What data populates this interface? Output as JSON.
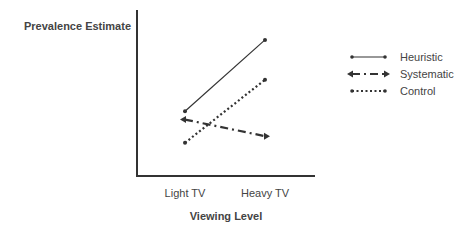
{
  "chart_data": {
    "type": "line",
    "title": "",
    "xlabel": "Viewing Level",
    "ylabel": "Prevalence Estimate",
    "categories": [
      "Light TV",
      "Heavy TV"
    ],
    "ylim": [
      0,
      10
    ],
    "y_ticks_shown": false,
    "grid": false,
    "legend_position": "right",
    "series": [
      {
        "name": "Heuristic",
        "values": [
          3.9,
          8.2
        ],
        "style": "solid",
        "marker": "dot",
        "color": "#333333"
      },
      {
        "name": "Systematic",
        "values": [
          3.4,
          2.4
        ],
        "style": "dash-dot",
        "marker": "arrow",
        "color": "#333333"
      },
      {
        "name": "Control",
        "values": [
          2.0,
          5.8
        ],
        "style": "dotted",
        "marker": "dot",
        "color": "#333333"
      }
    ]
  }
}
